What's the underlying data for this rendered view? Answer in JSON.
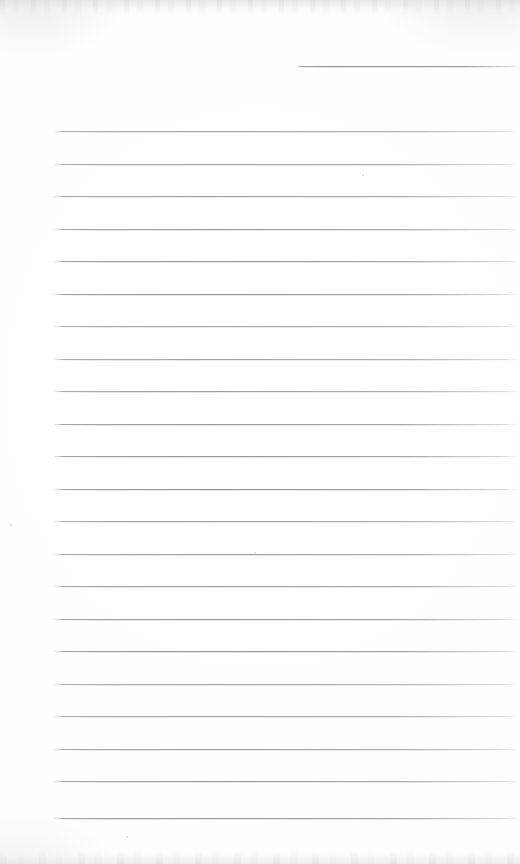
{
  "document": {
    "kind": "scanned-ruled-notepad-page",
    "page_width": 520,
    "page_height": 864,
    "paper_color": "#ffffff",
    "rule_color": "#8f9096",
    "content_text": "",
    "caption": ""
  },
  "ruling": {
    "line_spacing": 32.5,
    "line_thickness": 1,
    "full_rule_left": 54,
    "full_rule_right": 516,
    "first_full_rule_y": 131,
    "full_rule_count": 22,
    "partial_rule": {
      "label": "top-right-short-rule",
      "x_start": 297,
      "x_end": 517,
      "y": 66
    },
    "full_rule_y_positions": [
      131,
      163.5,
      196,
      228.5,
      261,
      293.5,
      326,
      358.5,
      391,
      423.5,
      456,
      488.5,
      521,
      553.5,
      586,
      618.5,
      651,
      683.5,
      716,
      748.5,
      781,
      818
    ]
  },
  "scan_artifacts": {
    "top_edge_band": "mottled-grey",
    "bottom_edge_band": "mottled-grey",
    "corner_vignettes": [
      "top-left",
      "top-right",
      "bottom-left"
    ],
    "speck_positions": [
      {
        "x": 10,
        "y": 524,
        "size": 2
      },
      {
        "x": 362,
        "y": 174,
        "size": 2
      },
      {
        "x": 126,
        "y": 836,
        "size": 2
      },
      {
        "x": 254,
        "y": 552,
        "size": 2
      }
    ]
  }
}
